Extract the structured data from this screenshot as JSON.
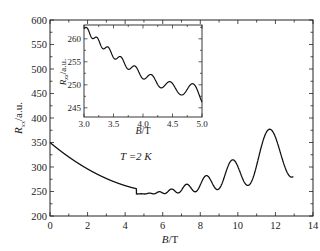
{
  "chart_data": [
    {
      "type": "line",
      "title": "",
      "xlabel": "B / T",
      "ylabel": "R_xx / a.u.",
      "xlim": [
        0,
        14
      ],
      "ylim": [
        200,
        600
      ],
      "xticks": [
        0,
        2,
        4,
        6,
        8,
        10,
        12,
        14
      ],
      "yticks": [
        200,
        250,
        300,
        350,
        400,
        450,
        500,
        550,
        600
      ],
      "annotation": "T = 2 K",
      "grid": false,
      "description": "Shubnikov-de Haas oscillations: decreasing background from 350 at B=0 to ~245 near 4.5 T, then growing oscillations up to ~550 at 12.7 T",
      "series": [
        {
          "name": "R_xx",
          "x": [
            0,
            1,
            2,
            3,
            4,
            4.5,
            5,
            6,
            7,
            8,
            9,
            10,
            11,
            11.5,
            12,
            12.7,
            13
          ],
          "values": [
            350,
            320,
            290,
            265,
            250,
            246,
            248,
            255,
            300,
            360,
            420,
            460,
            490,
            510,
            530,
            550,
            515
          ]
        }
      ],
      "peaks": [
        {
          "x": 9.4,
          "y": 445
        },
        {
          "x": 10.3,
          "y": 480
        },
        {
          "x": 11.2,
          "y": 515
        },
        {
          "x": 12.0,
          "y": 532
        },
        {
          "x": 12.7,
          "y": 552
        }
      ],
      "valleys": [
        {
          "x": 8.5,
          "y": 238
        },
        {
          "x": 9.0,
          "y": 240
        },
        {
          "x": 9.8,
          "y": 240
        },
        {
          "x": 10.8,
          "y": 255
        },
        {
          "x": 11.8,
          "y": 270
        }
      ]
    },
    {
      "type": "line",
      "title": "inset",
      "xlabel": "B / T",
      "ylabel": "R_xx / a.u.",
      "xlim": [
        3.0,
        5.0
      ],
      "ylim": [
        243,
        263
      ],
      "xticks": [
        3.0,
        3.5,
        4.0,
        4.5,
        5.0
      ],
      "yticks": [
        245,
        250,
        255,
        260
      ],
      "series": [
        {
          "name": "R_xx (inset)",
          "x": [
            3.0,
            3.25,
            3.5,
            3.75,
            4.0,
            4.25,
            4.5,
            4.75,
            5.0
          ],
          "values": [
            262,
            258,
            255,
            252,
            250,
            248,
            247,
            246.5,
            248
          ]
        }
      ]
    }
  ],
  "labels": {
    "main_xlabel_var": "B",
    "main_xlabel_unit": "/T",
    "main_ylabel_var": "R",
    "main_ylabel_sub": "xx",
    "main_ylabel_unit": "/a.u.",
    "temp_label": "T =2 K",
    "inset_xlabel_var": "B",
    "inset_xlabel_unit": "/T",
    "inset_ylabel_var": "R",
    "inset_ylabel_sub": "xx",
    "inset_ylabel_unit": "/a.u."
  }
}
